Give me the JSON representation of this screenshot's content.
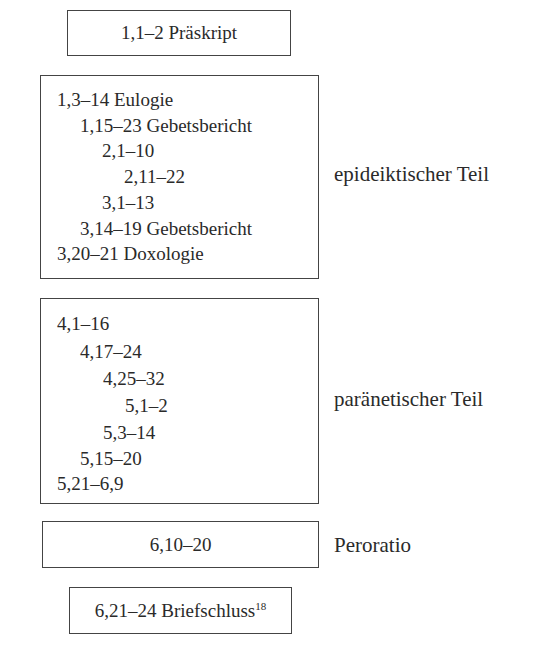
{
  "diagram": {
    "praescript": {
      "text": "1,1–2 Präskript"
    },
    "epideiktisch": {
      "label": "epideiktischer Teil",
      "lines": [
        {
          "text": "1,3–14 Eulogie",
          "indent": 0
        },
        {
          "text": "1,15–23 Gebetsbericht",
          "indent": 1
        },
        {
          "text": "2,1–10",
          "indent": 2
        },
        {
          "text": "2,11–22",
          "indent": 3
        },
        {
          "text": "3,1–13",
          "indent": 2
        },
        {
          "text": "3,14–19 Gebetsbericht",
          "indent": 1
        },
        {
          "text": "3,20–21 Doxologie",
          "indent": 0
        }
      ]
    },
    "paraenetisch": {
      "label": "paränetischer Teil",
      "lines": [
        {
          "text": "4,1–16",
          "indent": 0
        },
        {
          "text": "4,17–24",
          "indent": 1
        },
        {
          "text": "4,25–32",
          "indent": 2
        },
        {
          "text": "5,1–2",
          "indent": 3
        },
        {
          "text": "5,3–14",
          "indent": 2
        },
        {
          "text": "5,15–20",
          "indent": 1
        },
        {
          "text": "5,21–6,9",
          "indent": 0
        }
      ]
    },
    "peroratio": {
      "text": "6,10–20",
      "label": "Peroratio"
    },
    "briefschluss": {
      "text": "6,21–24 Briefschluss",
      "footnote": "18"
    }
  }
}
